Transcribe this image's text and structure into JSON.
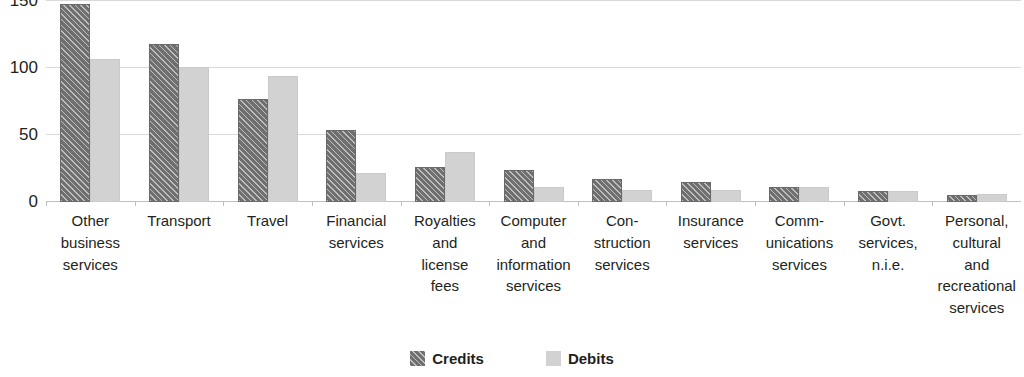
{
  "chart_data": {
    "type": "bar",
    "title": "",
    "subtitle": "",
    "xlabel": "",
    "ylabel": "",
    "ylim": [
      0,
      150
    ],
    "yticks": [
      0,
      50,
      100,
      150
    ],
    "ytick_labels": [
      "0",
      "50",
      "100",
      "150"
    ],
    "grid": true,
    "legend_position": "bottom",
    "categories": [
      "Other business services",
      "Transport",
      "Travel",
      "Financial services",
      "Royalties and license fees",
      "Computer and information services",
      "Construction services",
      "Insurance services",
      "Communications services",
      "Govt. services, n.i.e.",
      "Personal, cultural and recreational services"
    ],
    "category_label_lines": [
      [
        "Other",
        "business",
        "services"
      ],
      [
        "Transport"
      ],
      [
        "Travel"
      ],
      [
        "Financial",
        "services"
      ],
      [
        "Royalties",
        "and",
        "license",
        "fees"
      ],
      [
        "Computer",
        "and",
        "information",
        "services"
      ],
      [
        "Con-",
        "struction",
        "services"
      ],
      [
        "Insurance",
        "services"
      ],
      [
        "Comm-",
        "unications",
        "services"
      ],
      [
        "Govt.",
        "services,",
        "n.i.e."
      ],
      [
        "Personal,",
        "cultural",
        "and",
        "recreational",
        "services"
      ]
    ],
    "series": [
      {
        "name": "Credits",
        "color": "#6f6f6f",
        "pattern": "diagonal-hatch",
        "values": [
          148,
          118,
          77,
          54,
          26,
          24,
          17,
          15,
          11,
          8,
          5
        ]
      },
      {
        "name": "Debits",
        "color": "#d2d2d2",
        "pattern": "solid",
        "values": [
          107,
          101,
          94,
          22,
          37,
          11,
          9,
          9,
          11,
          8,
          6
        ]
      }
    ]
  },
  "legend": {
    "items": [
      {
        "label": "Credits",
        "swatch": "credits-swatch"
      },
      {
        "label": "Debits",
        "swatch": "debits-swatch"
      }
    ]
  },
  "colors": {
    "credits": "#6f6f6f",
    "debits": "#d2d2d2",
    "gridline": "#d9d9d9",
    "axis": "#bfbfbf",
    "text": "#231f20",
    "background": "#ffffff"
  }
}
